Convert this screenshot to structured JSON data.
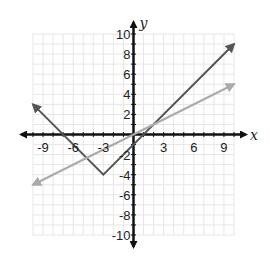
{
  "chart_data": {
    "type": "line",
    "title": "",
    "xlabel": "x",
    "ylabel": "y",
    "xlim": [
      -10,
      10
    ],
    "ylim": [
      -10,
      10
    ],
    "grid": true,
    "minor_grid_step": 1,
    "x_ticks": [
      -9,
      -6,
      -3,
      3,
      6,
      9
    ],
    "x_tick_labels": [
      "-9",
      "-6",
      "-3",
      "3",
      "6",
      "9"
    ],
    "y_ticks": [
      10,
      8,
      6,
      4,
      2,
      -2,
      -4,
      -6,
      -8,
      -10
    ],
    "y_tick_labels": [
      "10",
      "8",
      "6",
      "4",
      "2",
      "-2",
      "-4",
      "-6",
      "-8",
      "-10"
    ],
    "series": [
      {
        "name": "absolute-value-function",
        "description": "y = |x + 3| - 4",
        "color": "#555555",
        "arrows": "both",
        "points": [
          [
            -10,
            3
          ],
          [
            -3,
            -4
          ],
          [
            10,
            9
          ]
        ]
      },
      {
        "name": "linear-function",
        "description": "y = x / 2",
        "color": "#aaaaaa",
        "arrows": "both",
        "points": [
          [
            -10,
            -5
          ],
          [
            10,
            5
          ]
        ]
      }
    ]
  },
  "colors": {
    "axis": "#111111",
    "grid": "#e6e6e6",
    "background": "#ffffff"
  }
}
